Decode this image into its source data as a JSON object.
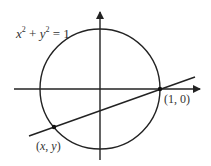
{
  "diagram": {
    "equation": {
      "x": "x",
      "x_exp": "2",
      "plus": " + ",
      "y": "y",
      "y_exp": "2",
      "equals": " = 1"
    },
    "point_a_label": "(1, 0)",
    "point_b_label": "(x, y)",
    "point_b_label_parts": {
      "open": "(",
      "x": "x",
      "comma": ", ",
      "y": "y",
      "close": ")"
    },
    "colors": {
      "stroke": "#222222",
      "text": "#333333",
      "background": "#ffffff"
    },
    "geometry": {
      "circle": {
        "cx": 100,
        "cy": 89,
        "r": 60
      },
      "x_axis": {
        "x1": 14,
        "y1": 89,
        "x2": 201,
        "y2": 89
      },
      "y_axis": {
        "x1": 100,
        "y1": 160,
        "x2": 100,
        "y2": 11
      },
      "secant_line": {
        "x1": 29,
        "y1": 136,
        "x2": 195,
        "y2": 77
      },
      "point_a": {
        "x": 160,
        "y": 89
      },
      "point_b": {
        "x": 54,
        "y": 127
      }
    }
  }
}
